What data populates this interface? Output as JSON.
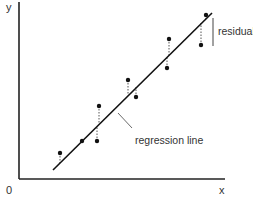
{
  "labels": {
    "y_axis": "y",
    "x_axis": "x",
    "origin": "0",
    "residual": "residual",
    "regression_line": "regression line"
  },
  "colors": {
    "axis": "#222222",
    "line": "#111111",
    "point": "#111111",
    "residual": "#555555",
    "text": "#333333"
  },
  "regression_line": {
    "x1": 53,
    "y1": 170,
    "x2": 212,
    "y2": 13
  },
  "points": [
    {
      "x": 60,
      "y": 153,
      "line_y": 163
    },
    {
      "x": 82,
      "y": 141,
      "line_y": 141
    },
    {
      "x": 99,
      "y": 106,
      "line_y": 124
    },
    {
      "x": 97,
      "y": 141,
      "line_y": 126
    },
    {
      "x": 128,
      "y": 80,
      "line_y": 95
    },
    {
      "x": 136,
      "y": 97,
      "line_y": 87
    },
    {
      "x": 169,
      "y": 39,
      "line_y": 55
    },
    {
      "x": 167,
      "y": 68,
      "line_y": 57
    },
    {
      "x": 206,
      "y": 15,
      "line_y": 19
    },
    {
      "x": 201,
      "y": 45,
      "line_y": 23
    }
  ]
}
